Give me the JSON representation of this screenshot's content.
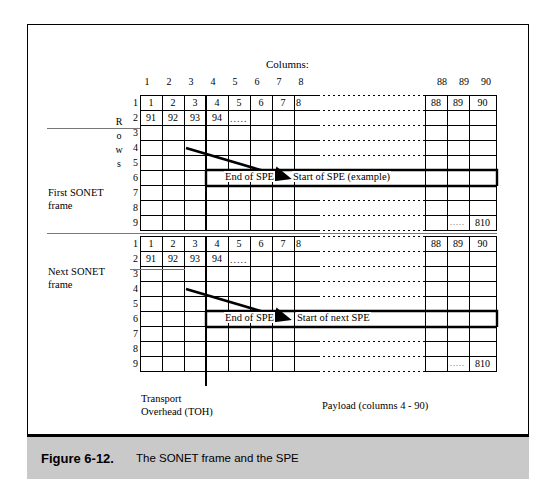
{
  "figure": {
    "caption_number": "Figure 6-12.",
    "caption_text": "The SONET frame and the SPE",
    "columns_header": "Columns:",
    "rows_header_letters": [
      "R",
      "o",
      "w",
      "s"
    ],
    "column_numbers_left": [
      "1",
      "2",
      "3",
      "4",
      "5",
      "6",
      "7",
      "8"
    ],
    "column_numbers_right": [
      "88",
      "89",
      "90"
    ],
    "row_numbers": [
      "1",
      "2",
      "3",
      "4",
      "5",
      "6",
      "7",
      "8",
      "9"
    ],
    "frame1_label_line1": "First SONET",
    "frame1_label_line2": "frame",
    "frame2_label_line1": "Next SONET",
    "frame2_label_line2": "frame",
    "toh_label_line1": "Transport",
    "toh_label_line2": "Overhead (TOH)",
    "payload_label": "Payload (columns 4 - 90)",
    "frame1": {
      "row1_cells": [
        "1",
        "2",
        "3",
        "4",
        "5",
        "6",
        "7",
        "8"
      ],
      "row1_right_cells": [
        "88",
        "89",
        "90"
      ],
      "row2_cells": [
        "91",
        "92",
        "93",
        "94"
      ],
      "row2_dots": ".....",
      "row9_dots": ".....",
      "row9_last_cell": "810",
      "end_of_spe": "End of SPE",
      "start_of_spe": "Start of SPE (example)"
    },
    "frame2": {
      "row1_cells": [
        "1",
        "2",
        "3",
        "4",
        "5",
        "6",
        "7",
        "8"
      ],
      "row1_right_cells": [
        "88",
        "89",
        "90"
      ],
      "row2_cells": [
        "91",
        "92",
        "93",
        "94"
      ],
      "row2_dots": ".....",
      "row9_dots": ".....",
      "row9_last_cell": "810",
      "end_of_spe": "End of SPE",
      "start_of_spe": "Start of next SPE"
    }
  },
  "colors": {
    "ink": "#000000",
    "caption_bar": "#c9c9c9",
    "separator": "#7a7a7a"
  }
}
